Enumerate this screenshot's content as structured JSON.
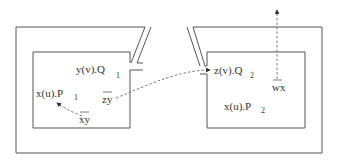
{
  "diagram": {
    "left_location": {
      "processes": [
        {
          "name": "y(v).Q",
          "subscript": "1"
        },
        {
          "name": "x(u).P",
          "subscript": "1"
        }
      ],
      "outputs": [
        {
          "name": "zy"
        },
        {
          "name": "xy"
        }
      ]
    },
    "right_location": {
      "processes": [
        {
          "name": "z(v).Q",
          "subscript": "2"
        },
        {
          "name": "x(u).P",
          "subscript": "2"
        }
      ],
      "outputs": [
        {
          "name": "wx"
        }
      ]
    }
  }
}
